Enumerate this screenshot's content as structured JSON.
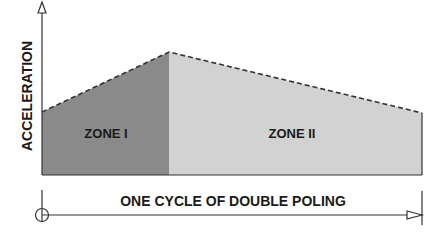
{
  "diagram": {
    "y_axis_label": "ACCELERATION",
    "x_axis_label": "ONE CYCLE OF DOUBLE POLING",
    "zones": [
      {
        "label": "ZONE I",
        "color": "#8a8a8a"
      },
      {
        "label": "ZONE II",
        "color": "#d2d2d2"
      }
    ],
    "line_color": "#333333"
  }
}
